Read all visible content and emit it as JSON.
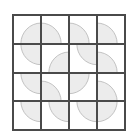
{
  "puzzle": {
    "rows": 4,
    "cols": 4,
    "colors": {
      "background": "#ffffff",
      "grid_line": "#4a4a4a",
      "arc_fill": "#ececec",
      "arc_stroke": "#b8b8b8"
    },
    "tiles": [
      [
        "bottom-right",
        "bottom-left",
        "bottom-left",
        "bottom-left"
      ],
      [
        "top-right",
        "bottom-right",
        "top-right",
        "bottom-left"
      ],
      [
        "top-right",
        "bottom-left",
        "top-left",
        "bottom-left"
      ],
      [
        "top-right",
        "top-right",
        "top-right",
        "top-left"
      ]
    ]
  }
}
